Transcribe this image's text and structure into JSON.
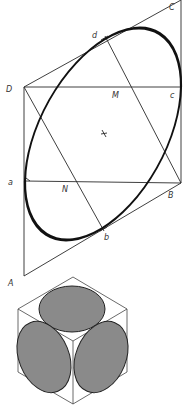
{
  "figure": {
    "labels": {
      "C": "C",
      "D": "D",
      "M": "M",
      "c": "c",
      "d": "d",
      "center": "x",
      "a": "a",
      "N": "N",
      "B": "B",
      "b": "b",
      "A": "A"
    },
    "colors": {
      "line": "#2a2a2a",
      "ellipse": "#111111",
      "shaded_face": "#8a8a8a",
      "background": "#ffffff"
    }
  }
}
